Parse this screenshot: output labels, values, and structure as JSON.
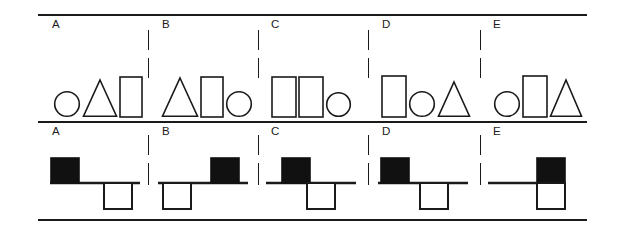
{
  "figure": {
    "panel_labels": [
      "A",
      "B",
      "C",
      "D",
      "E"
    ],
    "ink_color": "#1a1a1a",
    "background_color": "#ffffff",
    "fill_black": "#111111",
    "fill_white": "#ffffff"
  },
  "rules": {
    "top_label": "top-horizontal-rule",
    "middle_label": "middle-horizontal-rule",
    "bottom_label": "bottom-horizontal-rule"
  },
  "shape_row": {
    "name": "shape-sequence-row",
    "panels": [
      {
        "label": "A",
        "shapes": [
          "circle",
          "triangle",
          "rectangle"
        ]
      },
      {
        "label": "B",
        "shapes": [
          "triangle",
          "rectangle",
          "circle"
        ]
      },
      {
        "label": "C",
        "shapes": [
          "rectangle",
          "rectangle",
          "circle"
        ]
      },
      {
        "label": "D",
        "shapes": [
          "rectangle",
          "circle",
          "triangle"
        ]
      },
      {
        "label": "E",
        "shapes": [
          "circle",
          "rectangle",
          "triangle"
        ]
      }
    ]
  },
  "balance_row": {
    "name": "balance-beam-row",
    "panels": [
      {
        "label": "A",
        "beam": "horizontal-beam",
        "blocks": [
          {
            "fill": "black",
            "position": "left",
            "side": "above-beam"
          },
          {
            "fill": "white",
            "position": "right",
            "side": "below-beam"
          }
        ]
      },
      {
        "label": "B",
        "beam": "horizontal-beam",
        "blocks": [
          {
            "fill": "white",
            "position": "left",
            "side": "below-beam"
          },
          {
            "fill": "black",
            "position": "right",
            "side": "above-beam"
          }
        ]
      },
      {
        "label": "C",
        "beam": "horizontal-beam",
        "blocks": [
          {
            "fill": "black",
            "position": "center-left",
            "side": "above-beam"
          },
          {
            "fill": "white",
            "position": "center-right",
            "side": "below-beam"
          }
        ]
      },
      {
        "label": "D",
        "beam": "horizontal-beam",
        "blocks": [
          {
            "fill": "black",
            "position": "left",
            "side": "above-beam"
          },
          {
            "fill": "white",
            "position": "center-right",
            "side": "below-beam"
          }
        ]
      },
      {
        "label": "E",
        "beam": "horizontal-beam",
        "blocks": [
          {
            "fill": "black",
            "position": "right",
            "side": "above-beam"
          },
          {
            "fill": "white",
            "position": "right",
            "side": "below-beam"
          }
        ]
      }
    ]
  }
}
